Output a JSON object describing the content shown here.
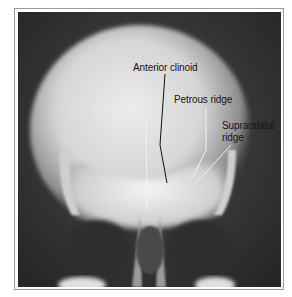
{
  "figure": {
    "type": "frontal skull radiograph",
    "labels": [
      {
        "text": "Anterior clinoid",
        "leader_color": "#111111"
      },
      {
        "text": "Petrous ridge",
        "leader_color": "#f2f2f2"
      },
      {
        "text": "Supraorbital",
        "text2": "ridge",
        "leader_color": "#f2f2f2"
      }
    ]
  },
  "colors": {
    "background": "#2a2a2a",
    "bone": "#e8e8e8",
    "frame": "#9a9a9a"
  }
}
